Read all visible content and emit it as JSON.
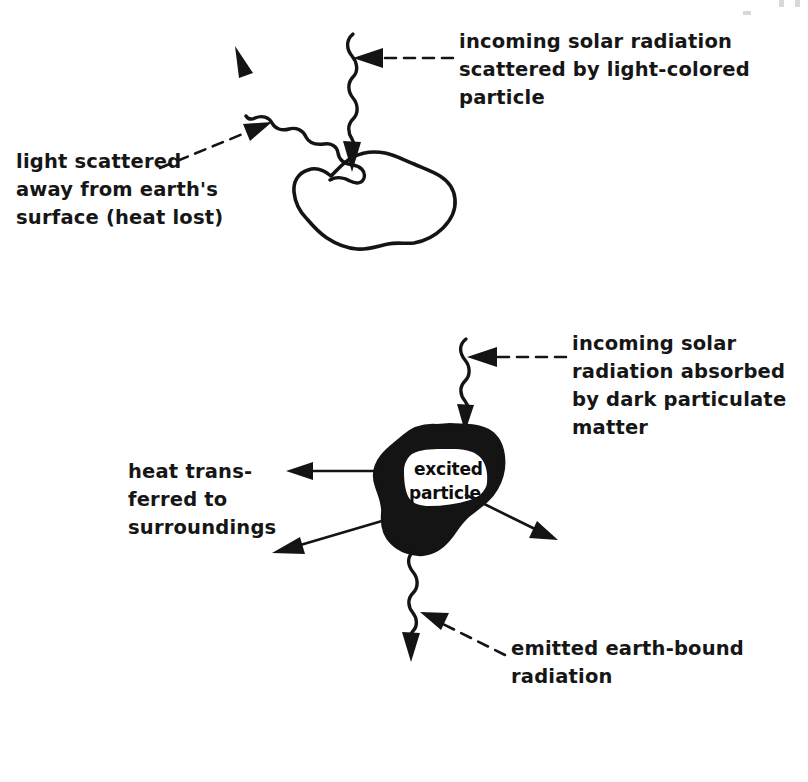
{
  "figure": {
    "background_color": "#ffffff",
    "ink_color": "#141414"
  },
  "panels": [
    {
      "id": "light-colored-particle",
      "particle": {
        "name": "light-colored particle",
        "fill": "#ffffff",
        "outline": "#141414"
      },
      "labels": {
        "incoming": {
          "lines": [
            "incoming solar radiation",
            "scattered by light-colored",
            "particle"
          ]
        },
        "scattered": {
          "lines": [
            "light scattered",
            "away from earth's",
            "surface (heat lost)"
          ]
        }
      },
      "rays": [
        {
          "name": "incoming-solar-ray",
          "style": "wavy",
          "direction": "down"
        },
        {
          "name": "scattered-ray",
          "style": "wavy",
          "direction": "up-left"
        }
      ]
    },
    {
      "id": "dark-particulate-matter",
      "particle": {
        "name": "excited particle",
        "fill": "#141414",
        "outline": "#141414",
        "inner_label": {
          "lines": [
            "excited",
            "particle"
          ]
        }
      },
      "labels": {
        "incoming": {
          "lines": [
            "incoming solar",
            "radiation absorbed",
            "by dark particulate",
            "matter"
          ]
        },
        "heat": {
          "lines": [
            "heat trans-",
            "ferred to",
            "surroundings"
          ]
        },
        "emitted": {
          "lines": [
            "emitted earth-bound",
            "radiation"
          ]
        }
      },
      "rays": [
        {
          "name": "incoming-solar-ray",
          "style": "wavy",
          "direction": "down"
        },
        {
          "name": "heat-arrow-left",
          "style": "solid",
          "direction": "left"
        },
        {
          "name": "heat-arrow-lower-left",
          "style": "solid",
          "direction": "down-left"
        },
        {
          "name": "heat-arrow-lower-right",
          "style": "solid",
          "direction": "down-right"
        },
        {
          "name": "emitted-ray",
          "style": "wavy",
          "direction": "down"
        }
      ]
    }
  ]
}
